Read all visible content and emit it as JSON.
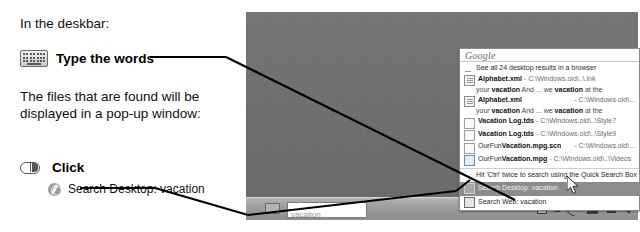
{
  "instructions": {
    "intro": "In the deskbar:",
    "step_type_label": "Type the words",
    "keyboard_icon": "keyboard-icon",
    "paragraph": "The files that are found will be displayed in a pop-up window:",
    "step_click_label": "Click",
    "mouse_icon": "mouse-click-icon",
    "click_target_icon": "google-desktop-icon",
    "click_target_label": "Search Desktop: vacation"
  },
  "desktop": {
    "taskbar": {
      "deskbar_icon": "deskbar-icon",
      "search_value": "vacation",
      "search_placeholder": "vacation",
      "tray_icons": [
        "dot-icon",
        "square-icon",
        "triangle-icon",
        "google-desktop-icon",
        "monitor-icon",
        "network-icon",
        "speaker-icon"
      ]
    }
  },
  "popup": {
    "brand": "Google",
    "see_all": "See all 24 desktop results in a browser",
    "results": [
      {
        "icon": "document-icon",
        "title": "Alphabet.xml",
        "sep": " - ",
        "path": "C:\\Windows.old\\..\\.lnk",
        "path_right": false,
        "snippet_pre": "your ",
        "snippet_b1": "vacation",
        "snippet_mid": " And ... we ",
        "snippet_b2": "vacation",
        "snippet_post": " at the"
      },
      {
        "icon": "document-icon",
        "title": "Alphabet.xml",
        "sep": " - ",
        "path": "C:\\Windows.old\\...",
        "path_right": true,
        "snippet_pre": "your ",
        "snippet_b1": "vacation",
        "snippet_mid": " And ... we ",
        "snippet_b2": "vacation",
        "snippet_post": " at the"
      },
      {
        "icon": "file-icon",
        "title_b": "Vacation",
        "title": " Log.tds",
        "sep": " - ",
        "path": "C:\\Windows.old\\..\\Style7",
        "path_right": false,
        "snippet_pre": ""
      },
      {
        "icon": "file-icon",
        "title_b": "Vacation",
        "title": " Log.tds",
        "sep": " - ",
        "path": "C:\\Windows.old\\..\\Style9",
        "path_right": false,
        "snippet_pre": ""
      },
      {
        "icon": "file-icon",
        "title_pre": "OurFun",
        "title_b": "Vacation",
        "title": ".mpg.scn",
        "sep": " - ",
        "path": "C:\\Windows.old\\...",
        "path_right": true,
        "snippet_pre": ""
      },
      {
        "icon": "video-icon",
        "title_pre": "OurFun",
        "title_b": "Vacation",
        "title": ".mpg",
        "sep": " - ",
        "path": "C:\\Windows.old\\..\\Videos",
        "path_right": false,
        "snippet_pre": ""
      }
    ],
    "hint": "Hit 'Ctrl' twice to search using the Quick Search Box",
    "action_desktop": "Search Desktop: vacation",
    "action_web": "Search Web: vacation"
  },
  "colors": {
    "desktop_bg": "#717171",
    "taskbar_bg": "#a6a6a6",
    "selection_bg": "#8c8c8c",
    "popup_bg": "#ffffff",
    "text": "#2a2a2a"
  }
}
